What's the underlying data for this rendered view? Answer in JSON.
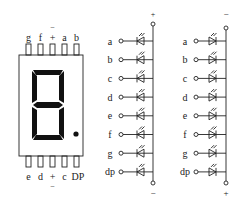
{
  "display": {
    "top_pins": [
      "g",
      "f",
      "+",
      "a",
      "b"
    ],
    "top_pin_common_overbar": "−",
    "bottom_pins": [
      "e",
      "d",
      "+",
      "c",
      "DP"
    ],
    "bottom_pin_common_underbar": "−",
    "digit_shown": "8",
    "decimal_point": true
  },
  "circuit_common_anode": {
    "top_terminal": "+",
    "bottom_terminal": "−",
    "segments": [
      "a",
      "b",
      "c",
      "d",
      "e",
      "f",
      "g",
      "dp"
    ]
  },
  "circuit_common_cathode": {
    "top_terminal": "−",
    "bottom_terminal": "+",
    "segments": [
      "a",
      "b",
      "c",
      "d",
      "e",
      "f",
      "g",
      "dp"
    ]
  }
}
